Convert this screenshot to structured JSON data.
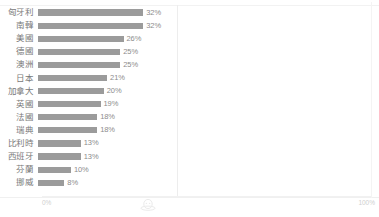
{
  "chart_data": {
    "type": "bar",
    "orientation": "horizontal",
    "title": "",
    "xlabel": "",
    "ylabel": "",
    "xlim": [
      0,
      100
    ],
    "xtick_labels": [
      "0%",
      "100%"
    ],
    "grid": false,
    "legend": null,
    "bar_color": "#9b9b9b",
    "value_suffix": "%",
    "categories": [
      "匈牙利",
      "南韓",
      "美國",
      "德國",
      "澳洲",
      "日本",
      "加拿大",
      "英國",
      "法國",
      "瑞典",
      "比利時",
      "西班牙",
      "芬蘭",
      "挪威"
    ],
    "values": [
      32,
      32,
      26,
      25,
      25,
      21,
      20,
      19,
      18,
      18,
      13,
      13,
      10,
      8
    ],
    "value_labels": [
      "32%",
      "32%",
      "26%",
      "25%",
      "25%",
      "21%",
      "20%",
      "19%",
      "18%",
      "18%",
      "13%",
      "13%",
      "10%",
      "8%"
    ],
    "rows": [
      {
        "category": "匈牙利",
        "value": 32,
        "label": "32%"
      },
      {
        "category": "南韓",
        "value": 32,
        "label": "32%"
      },
      {
        "category": "美國",
        "value": 26,
        "label": "26%"
      },
      {
        "category": "德國",
        "value": 25,
        "label": "25%"
      },
      {
        "category": "澳洲",
        "value": 25,
        "label": "25%"
      },
      {
        "category": "日本",
        "value": 21,
        "label": "21%"
      },
      {
        "category": "加拿大",
        "value": 20,
        "label": "20%"
      },
      {
        "category": "英國",
        "value": 19,
        "label": "19%"
      },
      {
        "category": "法國",
        "value": 18,
        "label": "18%"
      },
      {
        "category": "瑞典",
        "value": 18,
        "label": "18%"
      },
      {
        "category": "比利時",
        "value": 13,
        "label": "13%"
      },
      {
        "category": "西班牙",
        "value": 13,
        "label": "13%"
      },
      {
        "category": "芬蘭",
        "value": 10,
        "label": "10%"
      },
      {
        "category": "挪威",
        "value": 8,
        "label": "8%"
      }
    ]
  },
  "axis": {
    "min_tick": "0%",
    "max_tick": "100%"
  },
  "icons": {
    "watermark": "watermark-icon"
  }
}
